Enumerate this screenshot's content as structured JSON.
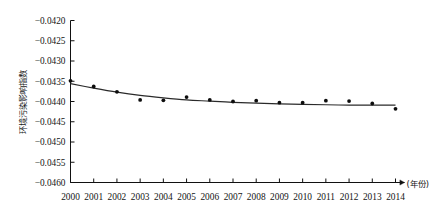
{
  "chart_data": {
    "type": "scatter",
    "title": "",
    "subtitle": "",
    "xlabel": "(年份)",
    "ylabel": "环境污染影响指数",
    "x": [
      2000,
      2001,
      2002,
      2003,
      2004,
      2005,
      2006,
      2007,
      2008,
      2009,
      2010,
      2011,
      2012,
      2013,
      2014
    ],
    "categories": [
      "2000",
      "2001",
      "2002",
      "2003",
      "2004",
      "2005",
      "2006",
      "2007",
      "2008",
      "2009",
      "2010",
      "2011",
      "2012",
      "2013",
      "2014"
    ],
    "series": [
      {
        "name": "环境污染影响指数",
        "marker": "filled-circle",
        "values": [
          -0.04349,
          -0.04363,
          -0.04376,
          -0.04396,
          -0.04397,
          -0.04389,
          -0.04396,
          -0.044,
          -0.04398,
          -0.04403,
          -0.04403,
          -0.04398,
          -0.04399,
          -0.04405,
          -0.04418
        ]
      },
      {
        "name": "拟合曲线",
        "marker": "none",
        "style": "smooth-trend-line",
        "values": [
          -0.04356,
          -0.04367,
          -0.04377,
          -0.04385,
          -0.04391,
          -0.04396,
          -0.04399,
          -0.04402,
          -0.04404,
          -0.04406,
          -0.04407,
          -0.04408,
          -0.04409,
          -0.04409,
          -0.04409
        ]
      }
    ],
    "ylim": [
      -0.046,
      -0.042
    ],
    "xlim": [
      2000,
      2014
    ],
    "yticks": [
      "-0.0420",
      "-0.0425",
      "-0.0430",
      "-0.0435",
      "-0.0440",
      "-0.0445",
      "-0.0450",
      "-0.0455",
      "-0.0460"
    ],
    "ytick_values": [
      -0.042,
      -0.0425,
      -0.043,
      -0.0435,
      -0.044,
      -0.0445,
      -0.045,
      -0.0455,
      -0.046
    ],
    "xticks": [
      "2000",
      "2001",
      "2002",
      "2003",
      "2004",
      "2005",
      "2006",
      "2007",
      "2008",
      "2009",
      "2010",
      "2011",
      "2012",
      "2013",
      "2014"
    ],
    "grid": false,
    "legend": "none",
    "legend_position": "none",
    "annotations": [],
    "colors": {
      "axis": "#111111",
      "marker": "#0d0d0d",
      "trend_line": "#2a2a2a",
      "background": "#ffffff"
    }
  },
  "axis": {
    "y_label": "环境污染影响指数",
    "x_unit_label": "(年份)",
    "y_tick_labels": [
      "-0.0420",
      "-0.0425",
      "-0.0430",
      "-0.0435",
      "-0.0440",
      "-0.0445",
      "-0.0450",
      "-0.0455",
      "-0.0460"
    ],
    "x_tick_labels": [
      "2000",
      "2001",
      "2002",
      "2003",
      "2004",
      "2005",
      "2006",
      "2007",
      "2008",
      "2009",
      "2010",
      "2011",
      "2012",
      "2013",
      "2014"
    ]
  }
}
